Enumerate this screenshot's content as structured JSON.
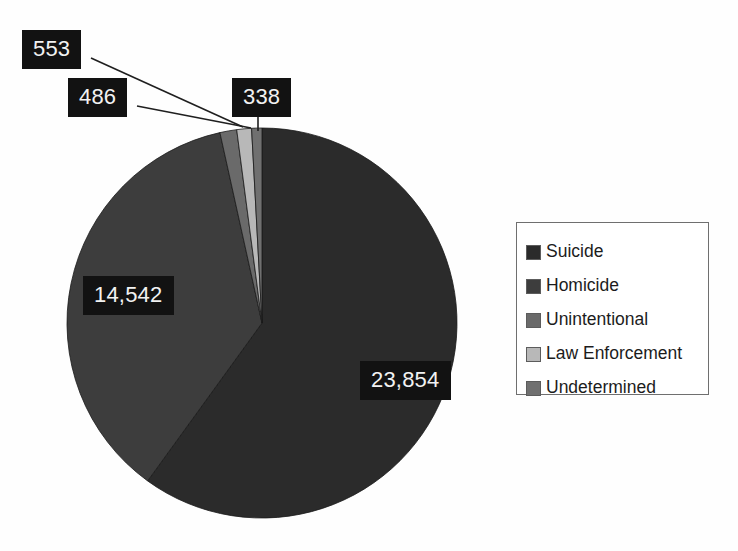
{
  "chart_data": {
    "type": "pie",
    "title": "",
    "subtitle": "",
    "xlabel": "",
    "ylabel": "",
    "grid": false,
    "legend_position": "right",
    "total": 39773,
    "categories": [
      "Suicide",
      "Homicide",
      "Unintentional",
      "Law Enforcement",
      "Undetermined"
    ],
    "values": [
      23854,
      14542,
      553,
      486,
      338
    ],
    "value_labels": [
      "23,854",
      "14,542",
      "553",
      "486",
      "338"
    ],
    "percentages": [
      59.98,
      36.56,
      1.39,
      1.22,
      0.85
    ],
    "colors": [
      "#2b2b2b",
      "#3d3d3d",
      "#6a6a6a",
      "#b8b8b8",
      "#707070"
    ],
    "start_angle_deg": 0,
    "direction": "clockwise"
  },
  "legend": {
    "items": [
      {
        "label": "Suicide",
        "color": "#2b2b2b"
      },
      {
        "label": "Homicide",
        "color": "#3d3d3d"
      },
      {
        "label": "Unintentional",
        "color": "#6a6a6a"
      },
      {
        "label": "Law Enforcement",
        "color": "#b8b8b8"
      },
      {
        "label": "Undetermined",
        "color": "#707070"
      }
    ]
  },
  "labels": {
    "unintentional": "553",
    "law_enforcement": "486",
    "undetermined": "338",
    "homicide": "14,542",
    "suicide": "23,854"
  },
  "style": {
    "label_background": "#121212",
    "label_text_color": "#f2f2f2",
    "legend_border": "#6f6f6f",
    "page_background": "#fefefe"
  }
}
